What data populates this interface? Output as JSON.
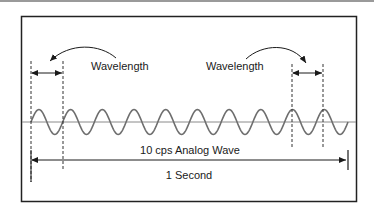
{
  "figure": {
    "labels": {
      "wavelength_left": "Wavelength",
      "wavelength_right": "Wavelength",
      "wave_caption": "10 cps Analog Wave",
      "duration": "1 Second"
    },
    "wave": {
      "cycles": 10,
      "frequency_cps": 10,
      "duration_seconds": 1
    },
    "colors": {
      "line": "#1a1a1a",
      "wave": "#6e6e6e",
      "axis": "#8a8a8a",
      "frame": "#222222",
      "top_strip": "#9a9a9a"
    }
  }
}
